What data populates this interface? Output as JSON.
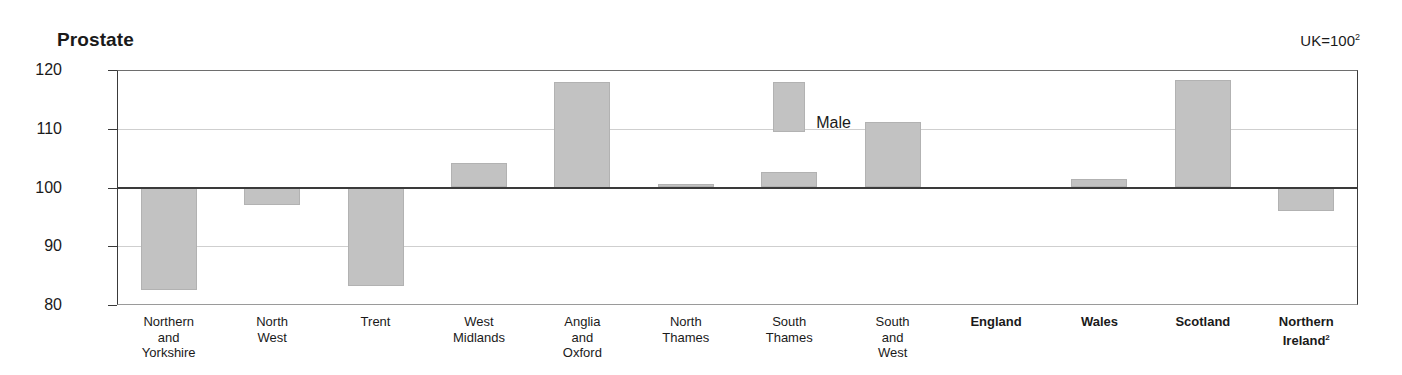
{
  "chart_data": {
    "type": "bar",
    "title": "Prostate",
    "subtitle": "",
    "annotation": "UK=100",
    "annotation_superscript": "2",
    "xlabel": "",
    "ylabel": "",
    "ylim": [
      80,
      120
    ],
    "baseline": 100,
    "yticks": [
      120,
      110,
      100,
      90,
      80
    ],
    "ytick_labels": [
      "120",
      "110",
      "100",
      "90",
      "80"
    ],
    "grid": true,
    "legend": {
      "position": "inside-top-center",
      "entries": [
        {
          "name": "Male",
          "color": "#c2c2c2"
        }
      ]
    },
    "categories": [
      "Northern\nand\nYorkshire",
      "North\nWest",
      "Trent",
      "West\nMidlands",
      "Anglia\nand\nOxford",
      "North\nThames",
      "South\nThames",
      "South\nand\nWest",
      "England",
      "Wales",
      "Scotland",
      "Northern\nIreland"
    ],
    "series": [
      {
        "name": "Male",
        "color": "#c2c2c2",
        "values": [
          82.5,
          97.0,
          83.3,
          104.2,
          118.0,
          100.6,
          102.7,
          111.2,
          100.0,
          101.4,
          118.3,
          96.0
        ]
      }
    ]
  },
  "axis": {
    "ticks": [
      {
        "label": "120",
        "value": 120
      },
      {
        "label": "110",
        "value": 110
      },
      {
        "label": "100",
        "value": 100
      },
      {
        "label": "90",
        "value": 90
      },
      {
        "label": "80",
        "value": 80
      }
    ]
  },
  "categories": [
    {
      "lines": [
        "Northern",
        "and",
        "Yorkshire"
      ],
      "bold": false,
      "superscript": ""
    },
    {
      "lines": [
        "North",
        "West"
      ],
      "bold": false,
      "superscript": ""
    },
    {
      "lines": [
        "Trent"
      ],
      "bold": false,
      "superscript": ""
    },
    {
      "lines": [
        "West",
        "Midlands"
      ],
      "bold": false,
      "superscript": ""
    },
    {
      "lines": [
        "Anglia",
        "and",
        "Oxford"
      ],
      "bold": false,
      "superscript": ""
    },
    {
      "lines": [
        "North",
        "Thames"
      ],
      "bold": false,
      "superscript": ""
    },
    {
      "lines": [
        "South",
        "Thames"
      ],
      "bold": false,
      "superscript": ""
    },
    {
      "lines": [
        "South",
        "and",
        "West"
      ],
      "bold": false,
      "superscript": ""
    },
    {
      "lines": [
        "England"
      ],
      "bold": true,
      "superscript": ""
    },
    {
      "lines": [
        "Wales"
      ],
      "bold": true,
      "superscript": ""
    },
    {
      "lines": [
        "Scotland"
      ],
      "bold": true,
      "superscript": ""
    },
    {
      "lines": [
        "Northern",
        "Ireland"
      ],
      "bold": true,
      "superscript": "2"
    }
  ],
  "header": {
    "title": "Prostate",
    "index_note": "UK=100",
    "index_note_sup": "2"
  },
  "legend": {
    "label": "Male",
    "swatch_color": "#c2c2c2"
  },
  "colors": {
    "bar_fill": "#c2c2c2",
    "bar_stroke": "#b2b2b2",
    "gridline": "#cfcfcf",
    "axis": "#3a3a3a",
    "text": "#1a1a1a"
  }
}
